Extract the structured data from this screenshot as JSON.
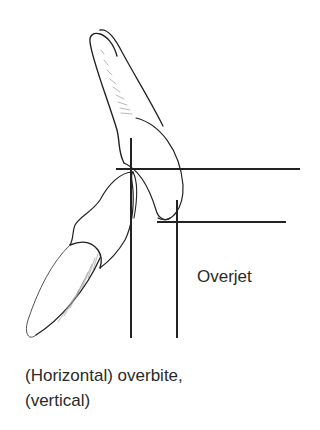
{
  "diagram": {
    "type": "dental occlusion illustration",
    "labels": {
      "overjet": "Overjet",
      "caption_line1": "(Horizontal) overbite,",
      "caption_line2": "(vertical)"
    },
    "elements": [
      {
        "name": "upper-incisor",
        "description": "Maxillary incisor tooth outline, tilted, crown tip pointing down-right"
      },
      {
        "name": "lower-incisor",
        "description": "Mandibular incisor tooth outline, tilted, crown tip pointing up-right"
      },
      {
        "name": "reference-lines",
        "description": "Two vertical and two horizontal measurement lines indicating overjet and overbite"
      }
    ],
    "colors": {
      "line": "#222222",
      "shading": "#9a9a9a",
      "text": "#2a2a2a",
      "background": "#ffffff"
    }
  }
}
